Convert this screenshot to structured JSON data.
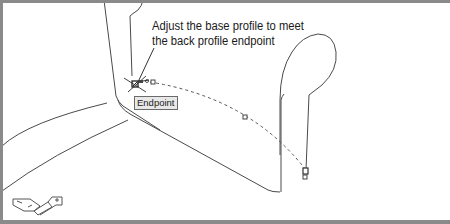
{
  "canvas": {
    "background": "#ffffff",
    "line_color": "#4a4a4a",
    "frame_color": "#8a8a8a"
  },
  "callout": {
    "line1": "Adjust the base profile to meet",
    "line2": "the back profile endpoint"
  },
  "osnap_tooltip": {
    "label": "Endpoint"
  },
  "icons": {
    "ucs": "ucs-axis-icon",
    "osnap_marker": "endpoint-marker-icon",
    "cursor": "crosshair-cursor-icon",
    "grip": "grip-icon"
  }
}
